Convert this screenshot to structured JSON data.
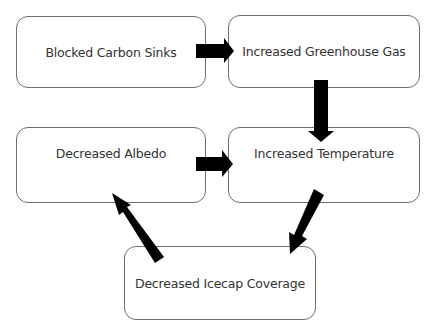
{
  "diagram": {
    "type": "flowchart",
    "nodes": [
      {
        "id": "n1",
        "label": "Blocked Carbon Sinks"
      },
      {
        "id": "n2",
        "label": "Increased Greenhouse Gas"
      },
      {
        "id": "n3",
        "label": "Decreased Albedo"
      },
      {
        "id": "n4",
        "label": "Increased Temperature"
      },
      {
        "id": "n5",
        "label": "Decreased Icecap Coverage"
      }
    ],
    "edges": [
      {
        "from": "n1",
        "to": "n2"
      },
      {
        "from": "n2",
        "to": "n4"
      },
      {
        "from": "n3",
        "to": "n4"
      },
      {
        "from": "n4",
        "to": "n5"
      },
      {
        "from": "n5",
        "to": "n3"
      }
    ],
    "colors": {
      "arrow": "#000000",
      "border": "#6f6f6f",
      "text": "#333333"
    }
  }
}
